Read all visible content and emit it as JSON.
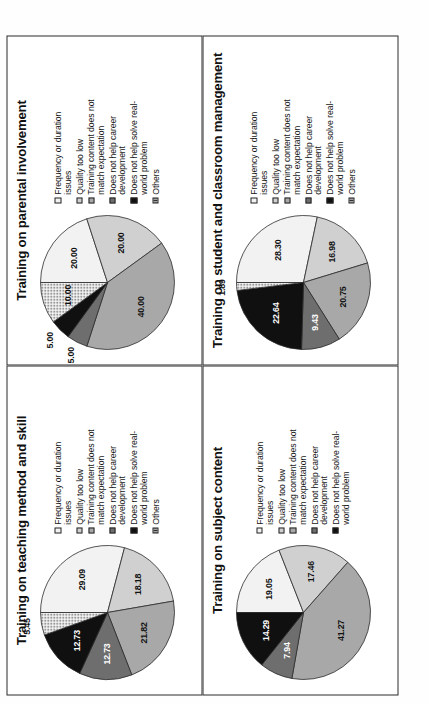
{
  "figure": {
    "caption": "",
    "palette": {
      "frequency": "#f2f2f2",
      "quality": "#d0d0d0",
      "content_mismatch": "#a8a8a8",
      "career": "#6e6e6e",
      "real_world": "#101010",
      "others": "#ffffff"
    },
    "legend_labels": {
      "frequency": "Frequency or duration\nissues",
      "quality": "Quality too low",
      "content_mismatch": "Training content does not\nmatch expectation",
      "career": "Does not help career\ndevelopment",
      "real_world": "Does not help solve real-\nworld problem",
      "others": "Others"
    }
  },
  "chart_data": [
    {
      "id": "teaching-method-and-skill",
      "type": "pie",
      "title": "Training on teaching method and skill",
      "categories": [
        "Frequency or duration issues",
        "Quality too low",
        "Training content does not match expectation",
        "Does not help career development",
        "Does not help solve real-world problem",
        "Others"
      ],
      "values": [
        29.09,
        18.18,
        21.82,
        12.73,
        12.73,
        5.45
      ],
      "labels": [
        "29.09",
        "18.18",
        "21.82",
        "12.73",
        "12.73",
        "5.45"
      ],
      "legend": [
        "Frequency or duration\nissues",
        "Quality too low",
        "Training content does not\nmatch expectation",
        "Does not help career\ndevelopment",
        "Does not help solve real-\nworld problem",
        "Others"
      ]
    },
    {
      "id": "parental-involvement",
      "type": "pie",
      "title": "Training on parental involvement",
      "categories": [
        "Frequency or duration issues",
        "Quality too low",
        "Training content does not match expectation",
        "Does not help career development",
        "Does not help solve real-world problem",
        "Others"
      ],
      "values": [
        20.0,
        20.0,
        40.0,
        5.0,
        5.0,
        10.0
      ],
      "labels": [
        "20.00",
        "20.00",
        "40.00",
        "5.00",
        "5.00",
        "10.00"
      ],
      "legend": [
        "Frequency or duration\nissues",
        "Quality too low",
        "Training content does not\nmatch expectation",
        "Does not help career\ndevelopment",
        "Does not help solve real-\nworld problem",
        "Others"
      ]
    },
    {
      "id": "subject-content",
      "type": "pie",
      "title": "Training on subject content",
      "categories": [
        "Frequency or duration issues",
        "Quality too low",
        "Training content does not match expectation",
        "Does not help career development",
        "Does not help solve real-world problem"
      ],
      "values": [
        19.05,
        17.46,
        41.27,
        7.94,
        14.29
      ],
      "labels": [
        "19.05",
        "17.46",
        "41.27",
        "7.94",
        "14.29"
      ],
      "legend": [
        "Frequency or duration\nissues",
        "Quality too low",
        "Training content does not\nmatch expectation",
        "Does not help career\ndevelopment",
        "Does not help solve real-\nworld problem"
      ]
    },
    {
      "id": "student-and-classroom-management",
      "type": "pie",
      "title": "Training on student and classroom\nmanagement",
      "categories": [
        "Frequency or duration issues",
        "Quality too low",
        "Training content does not match expectation",
        "Does not help career development",
        "Does not help solve real-world problem",
        "Others"
      ],
      "values": [
        28.3,
        16.98,
        20.75,
        9.43,
        22.64,
        1.89
      ],
      "labels": [
        "28.30",
        "16.98",
        "20.75",
        "9.43",
        "22.64",
        "1.89"
      ],
      "legend": [
        "Frequency or duration\nissues",
        "Quality too low",
        "Training content does not\nmatch expectation",
        "Does not help career\ndevelopment",
        "Does not help solve real-\nworld problem",
        "Others"
      ]
    }
  ]
}
